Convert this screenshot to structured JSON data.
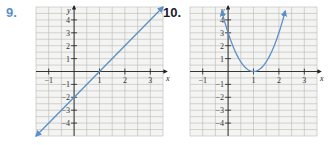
{
  "problems": [
    {
      "number": "9.",
      "color": "#5b8fc7"
    },
    {
      "number": "10.",
      "color": "#1a1a2e"
    }
  ],
  "chart_data": [
    {
      "type": "line",
      "title": "9.",
      "xlabel": "x",
      "ylabel": "y",
      "x_ticks": [
        -1,
        1,
        2,
        3
      ],
      "y_ticks": [
        -4,
        -3,
        -2,
        -1,
        1,
        2,
        3,
        4
      ],
      "xlim": [
        -1.5,
        3.5
      ],
      "ylim": [
        -5,
        5
      ],
      "grid": true,
      "grid_step": 0.5,
      "series": [
        {
          "name": "y = 2x - 2",
          "x": [
            -1.5,
            3.5
          ],
          "y": [
            -5,
            5
          ],
          "color": "#5b8fc7",
          "arrows": "both"
        }
      ]
    },
    {
      "type": "line",
      "title": "10.",
      "xlabel": "x",
      "ylabel": "y",
      "x_ticks": [
        -1,
        1,
        2,
        3
      ],
      "y_ticks": [
        -4,
        -3,
        -2,
        -1,
        1,
        2,
        3,
        4
      ],
      "xlim": [
        -1.5,
        3.5
      ],
      "ylim": [
        -5,
        5
      ],
      "grid": true,
      "grid_step": 0.5,
      "series": [
        {
          "name": "y = 3(x - 1)^2",
          "x": [
            -0.25,
            0,
            0.5,
            1,
            1.5,
            2,
            2.25
          ],
          "y": [
            4.69,
            3,
            0.75,
            0,
            0.75,
            3,
            4.69
          ],
          "color": "#5b8fc7",
          "arrows": "both"
        }
      ]
    }
  ],
  "labels": {
    "x_axis": "x",
    "y_axis": "y",
    "x_tick_labels": [
      "-1",
      "1",
      "2",
      "3"
    ],
    "y_tick_labels_pos": [
      "1",
      "2",
      "3",
      "4"
    ],
    "y_tick_labels_neg": [
      "-1",
      "-2",
      "-3",
      "-4"
    ]
  }
}
